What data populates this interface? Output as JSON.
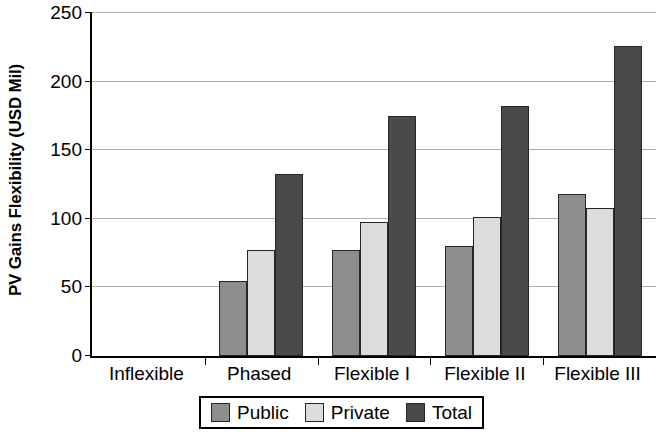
{
  "chart_data": {
    "type": "bar",
    "title": "",
    "subtitle": "",
    "xlabel": "",
    "ylabel": "PV Gains Flexibility (USD Mil)",
    "categories": [
      "Inflexible",
      "Phased",
      "Flexible I",
      "Flexible II",
      "Flexible III"
    ],
    "series": [
      {
        "name": "Public",
        "values": [
          0,
          55,
          77,
          80,
          118
        ]
      },
      {
        "name": "Private",
        "values": [
          0,
          77,
          98,
          101,
          108
        ]
      },
      {
        "name": "Total",
        "values": [
          0,
          133,
          175,
          182,
          226
        ]
      }
    ],
    "ylim": [
      0,
      250
    ],
    "ytick_labels": [
      "0",
      "50",
      "100",
      "150",
      "200",
      "250"
    ],
    "ytick_values": [
      0,
      50,
      100,
      150,
      200,
      250
    ],
    "grid": true,
    "grid_axis": "y",
    "legend_position": "bottom",
    "legend_entries": [
      "Public",
      "Private",
      "Total"
    ],
    "series_colors": [
      "#8e8e8e",
      "#dcdcdc",
      "#4a4a4a"
    ],
    "annotations": []
  }
}
